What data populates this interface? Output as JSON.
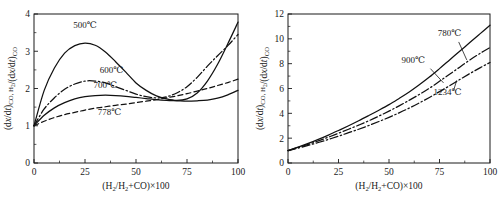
{
  "figure": {
    "background_color": "#ffffff",
    "line_color": "#111111",
    "panels": [
      "left",
      "right"
    ]
  },
  "chart_data": [
    {
      "id": "left-panel",
      "type": "line",
      "title": "",
      "xlabel": "(H₂/H₂+CO)×100",
      "ylabel": "(dx/dt)CO, H₂/(dx/dt)CO",
      "xlim": [
        0,
        100
      ],
      "ylim": [
        0,
        4
      ],
      "xticks": [
        0,
        25,
        50,
        75,
        100
      ],
      "xtick_labels": [
        "0",
        "25",
        "50",
        "75",
        "100"
      ],
      "xminor_step": 12.5,
      "yticks": [
        0,
        1,
        2,
        3,
        4
      ],
      "ytick_labels": [
        "0",
        "1",
        "2",
        "3",
        "4"
      ],
      "yminor_step": 0.5,
      "grid": false,
      "legend_position": "inline-annotations",
      "x": [
        0,
        5,
        10,
        15,
        20,
        25,
        30,
        35,
        40,
        45,
        50,
        55,
        60,
        65,
        70,
        75,
        80,
        85,
        90,
        95,
        100
      ],
      "series": [
        {
          "name": "500℃",
          "label": "500℃",
          "style": "solid",
          "label_x": 25,
          "label_y": 3.62,
          "values": [
            1.0,
            1.95,
            2.55,
            2.95,
            3.15,
            3.22,
            3.16,
            2.98,
            2.72,
            2.44,
            2.15,
            1.95,
            1.8,
            1.72,
            1.68,
            1.72,
            1.88,
            2.2,
            2.65,
            3.2,
            3.78
          ]
        },
        {
          "name": "600℃",
          "label": "600℃",
          "style": "dashdot",
          "label_x": 38,
          "label_y": 2.42,
          "values": [
            1.0,
            1.45,
            1.75,
            1.98,
            2.12,
            2.2,
            2.2,
            2.15,
            2.05,
            1.95,
            1.85,
            1.78,
            1.75,
            1.78,
            1.88,
            2.05,
            2.3,
            2.6,
            2.88,
            3.15,
            3.45
          ]
        },
        {
          "name": "700℃",
          "label": "700℃",
          "style": "solid",
          "label_x": 35,
          "label_y": 2.02,
          "values": [
            1.0,
            1.28,
            1.48,
            1.62,
            1.72,
            1.78,
            1.81,
            1.82,
            1.81,
            1.79,
            1.76,
            1.73,
            1.7,
            1.68,
            1.67,
            1.66,
            1.67,
            1.69,
            1.74,
            1.83,
            1.95
          ]
        },
        {
          "name": "778℃",
          "label": "778℃",
          "style": "dashed",
          "label_x": 37,
          "label_y": 1.28,
          "values": [
            1.0,
            1.12,
            1.22,
            1.3,
            1.36,
            1.42,
            1.47,
            1.51,
            1.55,
            1.58,
            1.62,
            1.66,
            1.7,
            1.75,
            1.8,
            1.86,
            1.93,
            2.0,
            2.08,
            2.16,
            2.25
          ]
        }
      ]
    },
    {
      "id": "right-panel",
      "type": "line",
      "title": "",
      "xlabel": "(H₂/H₂+CO)×100",
      "ylabel": "(dx/dt)CO, H₂/(dx/dt)CO",
      "xlim": [
        0,
        100
      ],
      "ylim": [
        0,
        12
      ],
      "xticks": [
        0,
        25,
        50,
        75,
        100
      ],
      "xtick_labels": [
        "0",
        "25",
        "50",
        "75",
        "100"
      ],
      "xminor_step": 12.5,
      "yticks": [
        0,
        2,
        4,
        6,
        8,
        10,
        12
      ],
      "ytick_labels": [
        "0",
        "2",
        "4",
        "6",
        "8",
        "10",
        "12"
      ],
      "yminor_step": 1,
      "grid": false,
      "legend_position": "inline-annotations-with-leaders",
      "x": [
        0,
        5,
        10,
        15,
        20,
        25,
        30,
        35,
        40,
        45,
        50,
        55,
        60,
        65,
        70,
        75,
        80,
        85,
        90,
        95,
        100
      ],
      "series": [
        {
          "name": "780℃",
          "label": "780℃",
          "style": "solid",
          "label_x": 80,
          "label_y": 10.25,
          "leader": {
            "x1": 84.5,
            "y1": 9.75,
            "x2": 88.5,
            "y2": 8.3
          },
          "values": [
            1.0,
            1.28,
            1.58,
            1.9,
            2.25,
            2.62,
            3.0,
            3.4,
            3.82,
            4.25,
            4.7,
            5.2,
            5.72,
            6.3,
            6.92,
            7.6,
            8.3,
            9.0,
            9.7,
            10.4,
            11.1
          ]
        },
        {
          "name": "900℃",
          "label": "900℃",
          "style": "dashdot",
          "label_x": 62,
          "label_y": 8.05,
          "leader": {
            "x1": 70.5,
            "y1": 7.6,
            "x2": 77.0,
            "y2": 6.45
          },
          "values": [
            1.0,
            1.25,
            1.5,
            1.78,
            2.08,
            2.4,
            2.72,
            3.05,
            3.4,
            3.78,
            4.18,
            4.6,
            5.05,
            5.52,
            6.02,
            6.58,
            7.15,
            7.72,
            8.3,
            8.82,
            9.3
          ]
        },
        {
          "name": "1234℃",
          "label": "1234℃",
          "style": "dashdot",
          "label_x": 79,
          "label_y": 5.45,
          "leader": {
            "x1": 82.0,
            "y1": 5.85,
            "x2": 83.5,
            "y2": 6.65
          },
          "values": [
            1.0,
            1.2,
            1.42,
            1.65,
            1.9,
            2.16,
            2.44,
            2.72,
            3.02,
            3.34,
            3.68,
            4.04,
            4.42,
            4.84,
            5.28,
            5.75,
            6.22,
            6.72,
            7.2,
            7.66,
            8.1
          ]
        }
      ]
    }
  ]
}
